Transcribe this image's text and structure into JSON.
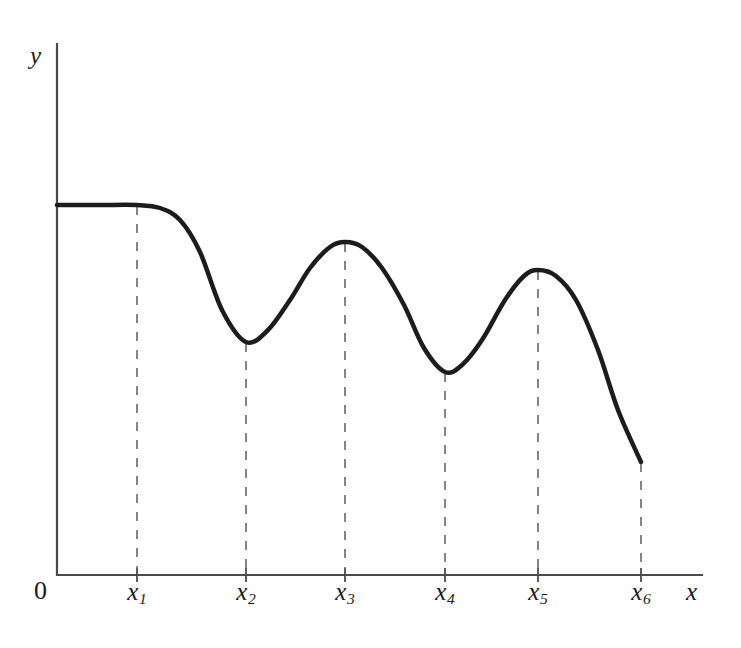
{
  "figure": {
    "background_color": "#ffffff",
    "width": 741,
    "height": 648
  },
  "axes": {
    "y_axis_label": "y",
    "x_axis_label": "x",
    "origin_label": "0",
    "axis_color": "#4a4a4a",
    "x_axis_y": 575,
    "y_axis_x": 57,
    "y_axis_top": 44,
    "x_axis_right": 702
  },
  "ticks": [
    {
      "label": "x",
      "sub": "1",
      "x": 137
    },
    {
      "label": "x",
      "sub": "2",
      "x": 246
    },
    {
      "label": "x",
      "sub": "3",
      "x": 345
    },
    {
      "label": "x",
      "sub": "4",
      "x": 445
    },
    {
      "label": "x",
      "sub": "5",
      "x": 538
    },
    {
      "label": "x",
      "sub": "6",
      "x": 641
    }
  ],
  "curve": {
    "color": "#1c1c1c",
    "width": 4.5,
    "description": "damped oscillating curve, flat then decreasing waves"
  },
  "dashed_guides": {
    "color": "#666666",
    "dash": "9 9",
    "width": 1.6
  },
  "chart_data": {
    "type": "line",
    "title": "",
    "xlabel": "x",
    "ylabel": "y",
    "grid": false,
    "legend": null,
    "xtick_labels": [
      "0",
      "x1",
      "x2",
      "x3",
      "x4",
      "x5",
      "x6"
    ],
    "ytick_labels": [],
    "xlim": [
      57,
      702
    ],
    "ylim": [
      44,
      575
    ],
    "annotations": [
      "vertical dashed guide line at x1",
      "vertical dashed guide line at x2",
      "vertical dashed guide line at x3",
      "vertical dashed guide line at x4",
      "vertical dashed guide line at x5",
      "vertical dashed guide line at x6"
    ],
    "series": [
      {
        "name": "f(x)",
        "points_px": [
          [
            57,
            205
          ],
          [
            100,
            205
          ],
          [
            137,
            205
          ],
          [
            160,
            208
          ],
          [
            180,
            220
          ],
          [
            200,
            252
          ],
          [
            222,
            310
          ],
          [
            246,
            342
          ],
          [
            268,
            330
          ],
          [
            290,
            300
          ],
          [
            310,
            268
          ],
          [
            330,
            247
          ],
          [
            345,
            242
          ],
          [
            362,
            247
          ],
          [
            382,
            268
          ],
          [
            404,
            305
          ],
          [
            424,
            348
          ],
          [
            445,
            372
          ],
          [
            462,
            365
          ],
          [
            482,
            340
          ],
          [
            505,
            300
          ],
          [
            524,
            276
          ],
          [
            538,
            270
          ],
          [
            556,
            276
          ],
          [
            576,
            300
          ],
          [
            598,
            350
          ],
          [
            618,
            410
          ],
          [
            641,
            462
          ]
        ],
        "key_points": {
          "start_value": 205,
          "flat_until_x": 137,
          "local_min_x2": 342,
          "local_max_x3": 242,
          "local_min_x4": 372,
          "local_max_x5": 270,
          "end_x6": 462
        }
      }
    ]
  }
}
